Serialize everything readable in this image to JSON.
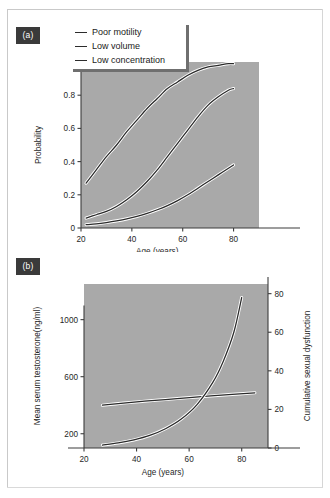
{
  "figure": {
    "panel_a_tag": "(a)",
    "panel_b_tag": "(b)"
  },
  "legend": {
    "items": [
      {
        "label": "Poor motility"
      },
      {
        "label": "Low volume"
      },
      {
        "label": "Low concentration"
      }
    ]
  },
  "chart_data": [
    {
      "type": "line",
      "panel": "(a)",
      "title": "",
      "xlabel": "Age (years)",
      "ylabel": "Probability",
      "xlim": [
        20,
        90
      ],
      "ylim": [
        0,
        1
      ],
      "xticks": [
        20,
        40,
        60,
        80
      ],
      "yticks": [
        0,
        0.2,
        0.4,
        0.6,
        0.8,
        1
      ],
      "ytick_labels": [
        "0",
        "0.2",
        "0.4",
        "0.6",
        "0.8",
        "1"
      ],
      "xtick_labels": [
        "20",
        "40",
        "60",
        "80"
      ],
      "grid": false,
      "legend_position": "top-left",
      "x": [
        22,
        26,
        30,
        34,
        38,
        42,
        46,
        50,
        54,
        58,
        62,
        66,
        70,
        74,
        78,
        80
      ],
      "series": [
        {
          "name": "Poor motility",
          "values": [
            0.27,
            0.35,
            0.43,
            0.5,
            0.58,
            0.65,
            0.72,
            0.78,
            0.84,
            0.88,
            0.92,
            0.95,
            0.97,
            0.98,
            0.99,
            0.99
          ]
        },
        {
          "name": "Low volume",
          "values": [
            0.06,
            0.08,
            0.1,
            0.13,
            0.17,
            0.22,
            0.28,
            0.35,
            0.43,
            0.51,
            0.59,
            0.67,
            0.74,
            0.79,
            0.83,
            0.84
          ]
        },
        {
          "name": "Low concentration",
          "values": [
            0.02,
            0.025,
            0.033,
            0.043,
            0.055,
            0.07,
            0.088,
            0.11,
            0.135,
            0.165,
            0.2,
            0.24,
            0.28,
            0.32,
            0.36,
            0.38
          ]
        }
      ]
    },
    {
      "type": "line",
      "panel": "(b)",
      "title": "",
      "xlabel": "Age (years)",
      "ylabel": "Mean serum testosterone(ng/ml)",
      "y2label": "Cumulative sexual dysfunction",
      "xlim": [
        20,
        90
      ],
      "ylim": [
        100,
        1250
      ],
      "y2lim": [
        0,
        85
      ],
      "xticks": [
        20,
        40,
        60,
        80
      ],
      "xtick_labels": [
        "20",
        "40",
        "60",
        "80"
      ],
      "yticks": [
        200,
        600,
        1000
      ],
      "ytick_labels": [
        "200",
        "600",
        "1000"
      ],
      "y2ticks": [
        0,
        20,
        40,
        60,
        80
      ],
      "y2tick_labels": [
        "0",
        "20",
        "40",
        "60",
        "80"
      ],
      "grid": false,
      "series": [
        {
          "name": "Mean serum testosterone(ng/ml)",
          "axis": "left",
          "x": [
            27,
            35,
            43,
            51,
            59,
            67,
            75,
            85
          ],
          "values": [
            400,
            415,
            428,
            440,
            452,
            463,
            474,
            487
          ]
        },
        {
          "name": "Cumulative sexual dysfunction",
          "axis": "right",
          "x": [
            27,
            33,
            39,
            45,
            51,
            57,
            63,
            69,
            73,
            77,
            80
          ],
          "values": [
            1.5,
            2.6,
            4.2,
            6.5,
            10.0,
            15.0,
            22.5,
            34.0,
            45.0,
            60.0,
            78.0
          ]
        }
      ]
    }
  ]
}
